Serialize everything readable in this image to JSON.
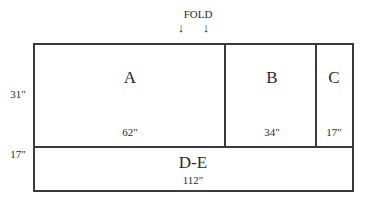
{
  "fold": {
    "label": "FOLD",
    "arrows": [
      "↓",
      "↓"
    ]
  },
  "panels": [
    {
      "id": "A",
      "label": "A",
      "width": "62\""
    },
    {
      "id": "B",
      "label": "B",
      "width": "34\""
    },
    {
      "id": "C",
      "label": "C",
      "width": "17\""
    },
    {
      "id": "D-E",
      "label": "D-E",
      "width": "112\""
    }
  ],
  "heights": {
    "top_row": "31\"",
    "bottom_row": "17\""
  }
}
